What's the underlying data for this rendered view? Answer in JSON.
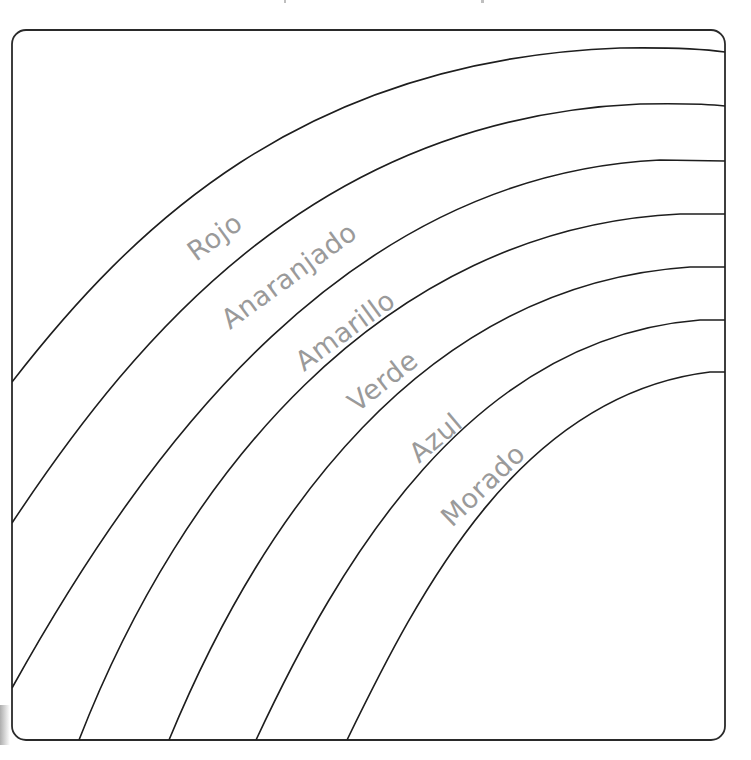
{
  "worksheet": {
    "frame": {
      "stroke_color": "#2a2a2a",
      "fill_color": "#ffffff"
    },
    "bands": [
      {
        "label": "Rojo"
      },
      {
        "label": "Anaranjado"
      },
      {
        "label": "Amarillo"
      },
      {
        "label": "Verde"
      },
      {
        "label": "Azul"
      },
      {
        "label": "Morado"
      }
    ],
    "label_color": "#9a9a9a",
    "line_color": "#1e1e1e"
  }
}
